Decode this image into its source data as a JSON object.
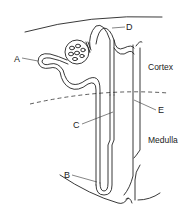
{
  "diagram": {
    "labels": {
      "A": "A",
      "B": "B",
      "C": "C",
      "D": "D",
      "E": "E"
    },
    "regions": {
      "cortex": "Cortex",
      "medulla": "Medulla"
    },
    "colors": {
      "line": "#222222",
      "background": "#ffffff"
    }
  }
}
